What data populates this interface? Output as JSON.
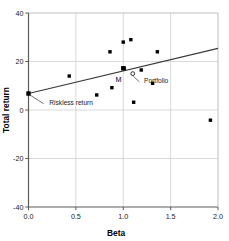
{
  "chart_data": {
    "type": "scatter",
    "title": "",
    "xlabel": "Beta",
    "ylabel": "Total return",
    "xlim": [
      0.0,
      2.0
    ],
    "ylim": [
      -40,
      40
    ],
    "xticks": [
      0.0,
      0.5,
      1.0,
      1.5,
      2.0
    ],
    "xtick_labels": [
      "0.0",
      "0.5",
      "1.0",
      "1.5",
      "2.0"
    ],
    "yticks": [
      40,
      20,
      0,
      -20,
      -40
    ],
    "ytick_labels": [
      "40",
      "20",
      "0",
      "-20",
      "-40"
    ],
    "grid": true,
    "legend": "none",
    "series": [
      {
        "name": "Portfolios",
        "marker": "filled-square",
        "color": "#000000",
        "points": [
          {
            "x": 0.43,
            "y": 14.0
          },
          {
            "x": 0.72,
            "y": 6.2
          },
          {
            "x": 0.86,
            "y": 24.0
          },
          {
            "x": 0.88,
            "y": 9.2
          },
          {
            "x": 1.0,
            "y": 28.0
          },
          {
            "x": 1.08,
            "y": 29.0
          },
          {
            "x": 1.01,
            "y": 17.2
          },
          {
            "x": 1.19,
            "y": 16.5
          },
          {
            "x": 1.11,
            "y": 3.2
          },
          {
            "x": 1.31,
            "y": 11.0
          },
          {
            "x": 1.36,
            "y": 24.0
          },
          {
            "x": 1.92,
            "y": -4.2
          }
        ]
      },
      {
        "name": "Market portfolio M",
        "marker": "filled-square-large",
        "color": "#000000",
        "points": [
          {
            "x": 1.0,
            "y": 17.2
          }
        ]
      },
      {
        "name": "Highlighted portfolio",
        "marker": "open-circle",
        "color": "#000000",
        "points": [
          {
            "x": 1.1,
            "y": 15.0
          }
        ]
      }
    ],
    "line": {
      "name": "Security market line",
      "color": "#3a3a3a",
      "x0": 0.0,
      "y0": 6.8,
      "x1": 2.0,
      "y1": 25.4
    },
    "riskless_point": {
      "x": 0.0,
      "y": 6.8
    },
    "annotations": [
      {
        "id": "riskless",
        "text": "Riskless return",
        "x": 0.22,
        "y": 2.0
      },
      {
        "id": "market",
        "text": "M",
        "x": 0.95,
        "y": 11.5
      },
      {
        "id": "portfolio",
        "text": "Portfolio",
        "x": 1.22,
        "y": 11.0
      }
    ]
  }
}
